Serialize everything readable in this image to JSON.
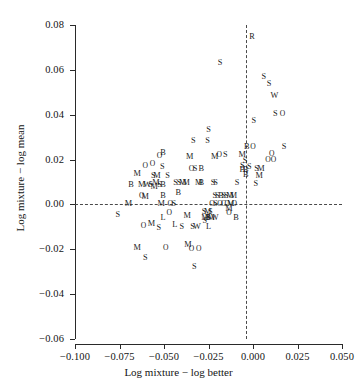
{
  "chart_data": {
    "type": "scatter",
    "title": "",
    "xlabel": "Log mixture − log better",
    "ylabel": "Log mixture − log mean",
    "xlim": [
      -0.1,
      0.05
    ],
    "ylim": [
      -0.06,
      0.08
    ],
    "xticks": [
      -0.1,
      -0.075,
      -0.05,
      -0.025,
      0.0,
      0.025,
      0.05
    ],
    "xticklabels": [
      "−0.100",
      "−0.075",
      "−0.050",
      "−0.025",
      "0.000",
      "0.025",
      "0.050"
    ],
    "yticks": [
      0.08,
      0.06,
      0.04,
      0.02,
      0.0,
      -0.02,
      -0.04,
      -0.06
    ],
    "yticklabels": [
      "0.08",
      "0.06",
      "0.04",
      "0.02",
      "0.00",
      "−0.02",
      "−0.04",
      "−0.06"
    ],
    "grid": false,
    "legend": "none",
    "reference_lines": [
      {
        "orientation": "horizontal",
        "value": 0.0,
        "style": "dashed"
      },
      {
        "orientation": "vertical",
        "value": 0.0,
        "style": "dashed"
      }
    ],
    "annotations": [
      {
        "name": "top-left",
        "text": "Mixtures exceed component mean but not better component (64 cases)",
        "lines": [
          "Mixtures exceed component",
          "mean but not better component",
          "(64 cases)"
        ]
      },
      {
        "name": "top-right",
        "text": "Mixtures exceed better component (26 cases)",
        "lines": [
          "Mixtures exceed",
          "better component",
          "(26 cases)"
        ]
      },
      {
        "name": "bottom-left",
        "text": "Mixtures fell below component mean (43 cases)",
        "lines": [
          "Mixtures fell below",
          "component mean",
          "(43 cases)"
        ]
      },
      {
        "name": "bottom-right",
        "text": "(excluded)",
        "lines": [
          "(excluded)"
        ]
      }
    ],
    "marker_labels": [
      "M",
      "S",
      "B",
      "O",
      "W",
      "L",
      "R"
    ],
    "points": [
      {
        "label": "R",
        "x": -0.0005,
        "y": 0.0745
      },
      {
        "label": "S",
        "x": -0.0185,
        "y": 0.063
      },
      {
        "label": "S",
        "x": 0.006,
        "y": 0.057
      },
      {
        "label": "S",
        "x": 0.009,
        "y": 0.0535
      },
      {
        "label": "W",
        "x": 0.012,
        "y": 0.0485
      },
      {
        "label": "S",
        "x": 0.0125,
        "y": 0.0405
      },
      {
        "label": "O",
        "x": 0.0165,
        "y": 0.0405
      },
      {
        "label": "S",
        "x": 0.0005,
        "y": 0.037
      },
      {
        "label": "S",
        "x": -0.025,
        "y": 0.033
      },
      {
        "label": "S",
        "x": -0.0335,
        "y": 0.0285
      },
      {
        "label": "S",
        "x": -0.0255,
        "y": 0.0285
      },
      {
        "label": "B",
        "x": -0.0035,
        "y": 0.0255
      },
      {
        "label": "O",
        "x": 0.0,
        "y": 0.0255
      },
      {
        "label": "S",
        "x": 0.0175,
        "y": 0.0255
      },
      {
        "label": "O",
        "x": -0.0525,
        "y": 0.0215
      },
      {
        "label": "B",
        "x": -0.0505,
        "y": 0.023
      },
      {
        "label": "M",
        "x": -0.0355,
        "y": 0.021
      },
      {
        "label": "M",
        "x": -0.0215,
        "y": 0.021
      },
      {
        "label": "O",
        "x": -0.019,
        "y": 0.022
      },
      {
        "label": "S",
        "x": -0.0155,
        "y": 0.022
      },
      {
        "label": "M",
        "x": -0.006,
        "y": 0.022
      },
      {
        "label": "S",
        "x": -0.0045,
        "y": 0.0195
      },
      {
        "label": "O",
        "x": 0.0085,
        "y": 0.02
      },
      {
        "label": "O",
        "x": 0.0115,
        "y": 0.02
      },
      {
        "label": "O",
        "x": 0.0105,
        "y": 0.0225
      },
      {
        "label": "O",
        "x": -0.0605,
        "y": 0.017
      },
      {
        "label": "O",
        "x": -0.0565,
        "y": 0.018
      },
      {
        "label": "S",
        "x": -0.051,
        "y": 0.0165
      },
      {
        "label": "O",
        "x": -0.0345,
        "y": 0.016
      },
      {
        "label": "S",
        "x": -0.0325,
        "y": 0.016
      },
      {
        "label": "B",
        "x": -0.029,
        "y": 0.016
      },
      {
        "label": "B",
        "x": -0.006,
        "y": 0.0155
      },
      {
        "label": "B",
        "x": -0.004,
        "y": 0.0155
      },
      {
        "label": "S",
        "x": -0.002,
        "y": 0.0165
      },
      {
        "label": "S",
        "x": -0.006,
        "y": 0.017
      },
      {
        "label": "S",
        "x": 0.002,
        "y": 0.016
      },
      {
        "label": "M",
        "x": 0.0045,
        "y": 0.016
      },
      {
        "label": "M",
        "x": -0.065,
        "y": 0.0135
      },
      {
        "label": "S",
        "x": -0.056,
        "y": 0.0125
      },
      {
        "label": "M",
        "x": -0.054,
        "y": 0.0125
      },
      {
        "label": "S",
        "x": -0.048,
        "y": 0.0125
      },
      {
        "label": "B",
        "x": -0.004,
        "y": 0.013
      },
      {
        "label": "M",
        "x": 0.0035,
        "y": 0.0125
      },
      {
        "label": "B",
        "x": -0.0685,
        "y": 0.0085
      },
      {
        "label": "M",
        "x": -0.0625,
        "y": 0.0085
      },
      {
        "label": "M",
        "x": -0.0545,
        "y": 0.0095
      },
      {
        "label": "W",
        "x": -0.0595,
        "y": 0.0085
      },
      {
        "label": "S",
        "x": -0.0575,
        "y": 0.0085
      },
      {
        "label": "M",
        "x": -0.0555,
        "y": 0.008
      },
      {
        "label": "S",
        "x": -0.0525,
        "y": 0.0085
      },
      {
        "label": "B",
        "x": -0.0505,
        "y": 0.0085
      },
      {
        "label": "S",
        "x": -0.0435,
        "y": 0.0095
      },
      {
        "label": "S",
        "x": -0.0415,
        "y": 0.0095
      },
      {
        "label": "M",
        "x": -0.0395,
        "y": 0.0095
      },
      {
        "label": "M",
        "x": -0.0375,
        "y": 0.0095
      },
      {
        "label": "M",
        "x": -0.0305,
        "y": 0.0095
      },
      {
        "label": "B",
        "x": -0.029,
        "y": 0.0095
      },
      {
        "label": "S",
        "x": -0.0225,
        "y": 0.0095
      },
      {
        "label": "S",
        "x": -0.021,
        "y": 0.0095
      },
      {
        "label": "S",
        "x": -0.009,
        "y": 0.0095
      },
      {
        "label": "S",
        "x": 0.0015,
        "y": 0.009
      },
      {
        "label": "O",
        "x": -0.0625,
        "y": 0.004
      },
      {
        "label": "M",
        "x": -0.0605,
        "y": 0.0035
      },
      {
        "label": "B",
        "x": -0.0505,
        "y": 0.004
      },
      {
        "label": "B",
        "x": -0.042,
        "y": 0.005
      },
      {
        "label": "S",
        "x": -0.0215,
        "y": 0.004
      },
      {
        "label": "S",
        "x": -0.02,
        "y": 0.004
      },
      {
        "label": "B",
        "x": -0.018,
        "y": 0.004
      },
      {
        "label": "S",
        "x": -0.0165,
        "y": 0.004
      },
      {
        "label": "S",
        "x": -0.015,
        "y": 0.004
      },
      {
        "label": "M",
        "x": -0.013,
        "y": 0.004
      },
      {
        "label": "M",
        "x": -0.011,
        "y": 0.004
      },
      {
        "label": "M",
        "x": -0.07,
        "y": 0.0
      },
      {
        "label": "M",
        "x": -0.0515,
        "y": 0.0
      },
      {
        "label": "O",
        "x": -0.0465,
        "y": 0.0
      },
      {
        "label": "S",
        "x": -0.0445,
        "y": 0.0
      },
      {
        "label": "O",
        "x": -0.023,
        "y": 0.0
      },
      {
        "label": "S",
        "x": -0.021,
        "y": 0.0
      },
      {
        "label": "O",
        "x": -0.0185,
        "y": 0.0
      },
      {
        "label": "C",
        "x": -0.0165,
        "y": 0.0
      },
      {
        "label": "O",
        "x": -0.0145,
        "y": 0.0
      },
      {
        "label": "M",
        "x": -0.0125,
        "y": 0.0
      },
      {
        "label": "O",
        "x": -0.0105,
        "y": 0.0
      },
      {
        "label": "M",
        "x": -0.0135,
        "y": -0.002
      },
      {
        "label": "O",
        "x": -0.0135,
        "y": -0.004
      },
      {
        "label": "S",
        "x": -0.076,
        "y": -0.0045
      },
      {
        "label": "O",
        "x": -0.047,
        "y": -0.004
      },
      {
        "label": "M",
        "x": -0.037,
        "y": -0.005
      },
      {
        "label": "S",
        "x": -0.0275,
        "y": -0.0035
      },
      {
        "label": "M",
        "x": -0.0255,
        "y": -0.0035
      },
      {
        "label": "S",
        "x": -0.024,
        "y": -0.0035
      },
      {
        "label": "M",
        "x": -0.027,
        "y": -0.006
      },
      {
        "label": "S",
        "x": -0.025,
        "y": -0.006
      },
      {
        "label": "S",
        "x": -0.027,
        "y": -0.0075
      },
      {
        "label": "B",
        "x": -0.0255,
        "y": -0.006
      },
      {
        "label": "M",
        "x": -0.0235,
        "y": -0.006
      },
      {
        "label": "W",
        "x": -0.0215,
        "y": -0.006
      },
      {
        "label": "B",
        "x": -0.0095,
        "y": -0.006
      },
      {
        "label": "L",
        "x": -0.0505,
        "y": -0.006
      },
      {
        "label": "M",
        "x": -0.057,
        "y": -0.0085
      },
      {
        "label": "O",
        "x": -0.0615,
        "y": -0.0095
      },
      {
        "label": "L",
        "x": -0.044,
        "y": -0.009
      },
      {
        "label": "S",
        "x": -0.053,
        "y": -0.0105
      },
      {
        "label": "S",
        "x": -0.04,
        "y": -0.01
      },
      {
        "label": "S",
        "x": -0.034,
        "y": -0.01
      },
      {
        "label": "W",
        "x": -0.0315,
        "y": -0.01
      },
      {
        "label": "L",
        "x": -0.025,
        "y": -0.01
      },
      {
        "label": "M",
        "x": -0.065,
        "y": -0.0195
      },
      {
        "label": "O",
        "x": -0.049,
        "y": -0.0195
      },
      {
        "label": "M",
        "x": -0.0365,
        "y": -0.018
      },
      {
        "label": "O",
        "x": -0.0345,
        "y": -0.02
      },
      {
        "label": "O",
        "x": -0.0305,
        "y": -0.02
      },
      {
        "label": "S",
        "x": -0.0605,
        "y": -0.024
      },
      {
        "label": "S",
        "x": -0.033,
        "y": -0.028
      }
    ]
  }
}
